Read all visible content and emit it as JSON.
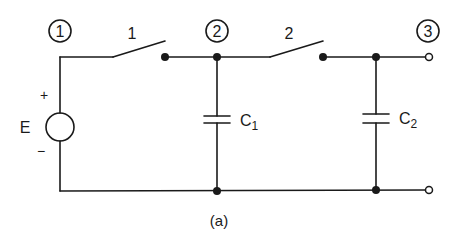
{
  "diagram": {
    "type": "circuit",
    "caption": "(a)",
    "nodes": [
      {
        "id": "1",
        "label": "1"
      },
      {
        "id": "2",
        "label": "2"
      },
      {
        "id": "3",
        "label": "3"
      }
    ],
    "switches": [
      {
        "id": "sw1",
        "label": "1",
        "between": [
          "1",
          "2"
        ],
        "state": "open"
      },
      {
        "id": "sw2",
        "label": "2",
        "between": [
          "2",
          "3"
        ],
        "state": "open"
      }
    ],
    "source": {
      "label": "E",
      "plus": "+",
      "minus": "−"
    },
    "capacitors": [
      {
        "id": "C1",
        "base": "C",
        "sub": "1",
        "node": "2"
      },
      {
        "id": "C2",
        "base": "C",
        "sub": "2",
        "node": "3"
      }
    ],
    "colors": {
      "line": "#1a1a1a",
      "background": "#ffffff"
    }
  }
}
